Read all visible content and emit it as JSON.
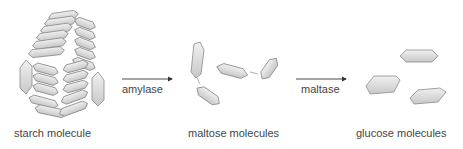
{
  "diagram": {
    "stages": [
      {
        "label": "starch molecule"
      },
      {
        "label": "maltose molecules"
      },
      {
        "label": "glucose molecules"
      }
    ],
    "arrows": [
      {
        "label": "amylase"
      },
      {
        "label": "maltase"
      }
    ],
    "colors": {
      "fill": "#d9d9d9",
      "stroke": "#8a8a8a",
      "arrow": "#333333",
      "text": "#444444"
    }
  }
}
